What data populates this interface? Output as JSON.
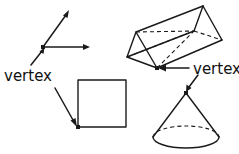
{
  "figure": {
    "background_color": "#ffffff",
    "stroke_color": "#1a1a1a",
    "labels": {
      "left_vertex": "vertex",
      "right_vertex": "vertex"
    },
    "shapes": {
      "angle": {
        "name": "angle-with-two-rays",
        "vertex_point": [
          43,
          47
        ],
        "ray_up_end": [
          69,
          11
        ],
        "ray_right_end": [
          89,
          47
        ]
      },
      "square": {
        "name": "square",
        "x": 78,
        "y": 80,
        "width": 48,
        "height": 47,
        "marked_vertex": [
          78,
          127
        ]
      },
      "prism": {
        "name": "triangular-prism",
        "front_apex": [
          136,
          32
        ],
        "front_left": [
          127,
          57
        ],
        "front_bottom": [
          157,
          68
        ],
        "back_apex": [
          203,
          6
        ],
        "back_right": [
          222,
          40
        ],
        "back_bottom": [
          213,
          53
        ],
        "marked_vertex": [
          157,
          68
        ]
      },
      "cone": {
        "name": "cone",
        "apex": [
          186,
          93
        ],
        "base_center": [
          186,
          137
        ],
        "base_rx": 33,
        "base_ry": 11,
        "marked_vertex": [
          186,
          93
        ]
      }
    },
    "pointers": [
      {
        "name": "left-label-to-angle-vertex",
        "from": [
          30,
          66
        ],
        "to": [
          41,
          49
        ]
      },
      {
        "name": "left-label-to-square-vertex",
        "from": [
          55,
          88
        ],
        "to": [
          76,
          125
        ]
      },
      {
        "name": "right-label-to-prism-vertex",
        "from": [
          189,
          68
        ],
        "to": [
          160,
          68
        ]
      },
      {
        "name": "right-label-to-cone-apex",
        "from": [
          196,
          76
        ],
        "to": [
          187,
          91
        ]
      }
    ]
  }
}
